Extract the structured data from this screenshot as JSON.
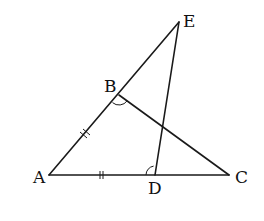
{
  "diagram": {
    "type": "geometry-figure",
    "colors": {
      "line": "#1a1a1a",
      "text": "#111111",
      "background": "#ffffff"
    },
    "points": {
      "A": {
        "label": "A",
        "x": 49,
        "y": 175,
        "label_x": 33,
        "label_y": 183
      },
      "B": {
        "label": "B",
        "x": 119,
        "y": 95,
        "label_x": 104,
        "label_y": 92
      },
      "C": {
        "label": "C",
        "x": 229,
        "y": 175,
        "label_x": 235,
        "label_y": 183
      },
      "D": {
        "label": "D",
        "x": 155,
        "y": 175,
        "label_x": 148,
        "label_y": 194
      },
      "E": {
        "label": "E",
        "x": 179,
        "y": 22,
        "label_x": 183,
        "label_y": 27
      }
    },
    "segments": [
      {
        "name": "segment-AE",
        "from": "A",
        "to": "E"
      },
      {
        "name": "segment-AC",
        "from": "A",
        "to": "C"
      },
      {
        "name": "segment-BC",
        "from": "B",
        "to": "C"
      },
      {
        "name": "segment-DE",
        "from": "D",
        "to": "E"
      }
    ],
    "equal_marks": [
      {
        "segment": "AB",
        "marks": 2
      },
      {
        "segment": "AD",
        "marks": 2
      }
    ],
    "angle_marks": [
      {
        "vertex": "B",
        "between": [
          "A",
          "C"
        ]
      },
      {
        "vertex": "D",
        "between": [
          "A",
          "E"
        ]
      }
    ]
  }
}
